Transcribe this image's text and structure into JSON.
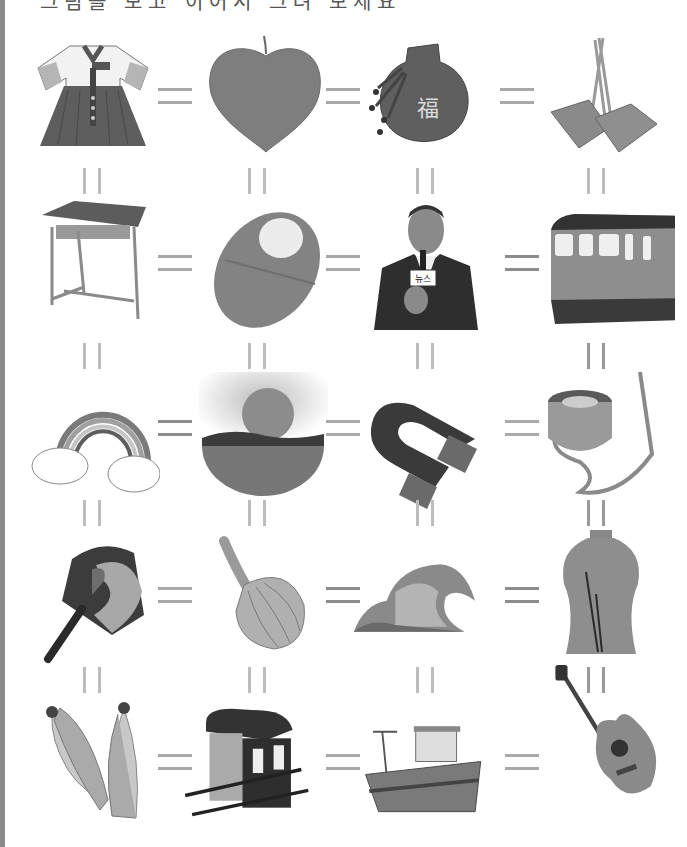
{
  "page": {
    "title_clipped": "그림을 보고 이어서 그려 보세요",
    "left_strip_color": "#8a8a8a",
    "connector_color": "#a9a9a9"
  },
  "grid": {
    "rows": 5,
    "cols": 4,
    "cells": [
      {
        "row": 0,
        "col": 0,
        "name": "hanbok",
        "label": "한복",
        "icon": "hanbok-icon"
      },
      {
        "row": 0,
        "col": 1,
        "name": "peach",
        "label": "복숭아",
        "icon": "peach-icon"
      },
      {
        "row": 0,
        "col": 2,
        "name": "lucky-pouch",
        "label": "복주머니",
        "icon": "pouch-icon",
        "text": "福"
      },
      {
        "row": 0,
        "col": 3,
        "name": "scoop-basket",
        "label": "복조리",
        "icon": "basket-icon"
      },
      {
        "row": 1,
        "col": 0,
        "name": "school-desk",
        "label": "책상",
        "icon": "desk-icon"
      },
      {
        "row": 1,
        "col": 1,
        "name": "swaddled-baby",
        "label": "아기",
        "icon": "baby-icon"
      },
      {
        "row": 1,
        "col": 2,
        "name": "news-reporter",
        "label": "기자",
        "icon": "reporter-icon",
        "text": "뉴스"
      },
      {
        "row": 1,
        "col": 3,
        "name": "train",
        "label": "기차",
        "icon": "train-icon"
      },
      {
        "row": 2,
        "col": 0,
        "name": "rainbow",
        "label": "무지개",
        "icon": "rainbow-icon"
      },
      {
        "row": 2,
        "col": 1,
        "name": "sunset-sea",
        "label": "노을",
        "icon": "sunset-icon"
      },
      {
        "row": 2,
        "col": 2,
        "name": "magnet",
        "label": "자석",
        "icon": "magnet-icon"
      },
      {
        "row": 2,
        "col": 3,
        "name": "canteen",
        "label": "수통",
        "icon": "canteen-icon"
      },
      {
        "row": 3,
        "col": 0,
        "name": "taeguk-fan",
        "label": "부채",
        "icon": "fan-icon"
      },
      {
        "row": 3,
        "col": 1,
        "name": "onion",
        "label": "양파",
        "icon": "onion-icon"
      },
      {
        "row": 3,
        "col": 2,
        "name": "wave",
        "label": "파도",
        "icon": "wave-icon"
      },
      {
        "row": 3,
        "col": 3,
        "name": "celadon-vase",
        "label": "도자기",
        "icon": "vase-icon"
      },
      {
        "row": 4,
        "col": 0,
        "name": "corn",
        "label": "옥수수",
        "icon": "corn-icon"
      },
      {
        "row": 4,
        "col": 1,
        "name": "palanquin",
        "label": "가마",
        "icon": "palanquin-icon"
      },
      {
        "row": 4,
        "col": 2,
        "name": "fishing-boat",
        "label": "배",
        "icon": "boat-icon"
      },
      {
        "row": 4,
        "col": 3,
        "name": "guitar",
        "label": "기타",
        "icon": "guitar-icon"
      }
    ]
  },
  "connectors": {
    "horizontal_symbol": "=",
    "vertical_symbol": "||"
  }
}
